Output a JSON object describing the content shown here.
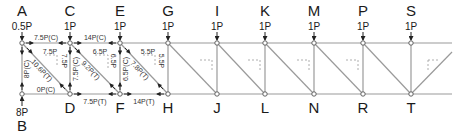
{
  "diagram": {
    "type": "truss-method-of-joints",
    "colors": {
      "member": "#9a9a9a",
      "node_fill": "#ffffff",
      "node_stroke": "#555555",
      "text": "#1a1a1a",
      "arrow": "#222222",
      "dashed": "#9a9a9a"
    },
    "top_nodes": [
      {
        "id": "A",
        "x": 22,
        "load": "0.5P"
      },
      {
        "id": "C",
        "x": 70,
        "load": "1P"
      },
      {
        "id": "E",
        "x": 120,
        "load": "1P"
      },
      {
        "id": "G",
        "x": 168,
        "load": "1P"
      },
      {
        "id": "I",
        "x": 217,
        "load": "1P"
      },
      {
        "id": "K",
        "x": 265,
        "load": "1P"
      },
      {
        "id": "M",
        "x": 314,
        "load": "1P"
      },
      {
        "id": "P",
        "x": 363,
        "load": "1P"
      },
      {
        "id": "S",
        "x": 411,
        "load": "1P"
      }
    ],
    "bottom_nodes": [
      {
        "id": "B",
        "x": 22,
        "load": "8P"
      },
      {
        "id": "D",
        "x": 70
      },
      {
        "id": "F",
        "x": 120
      },
      {
        "id": "H",
        "x": 168
      },
      {
        "id": "J",
        "x": 217
      },
      {
        "id": "L",
        "x": 265
      },
      {
        "id": "N",
        "x": 314
      },
      {
        "id": "R",
        "x": 363
      },
      {
        "id": "T",
        "x": 411
      }
    ],
    "member_forces": {
      "AC": "7.5P(C)",
      "CE": "14P(C)",
      "AB": "8P(C)",
      "AD": "10.6P(T)",
      "AD_h": "7.5P",
      "AD_v": "7.5P",
      "BD": "0P(C)",
      "CD": "7.5P(C)",
      "CF": "9.2P(T)",
      "CF_h": "6.5P",
      "CF_v": "6.5P",
      "DF": "7.5P(T)",
      "EF": "6.5P(C)",
      "EH": "7.8P(T)",
      "EH_h": "5.5P",
      "EH_v": "5.5P",
      "FH": "14P(T)"
    }
  }
}
